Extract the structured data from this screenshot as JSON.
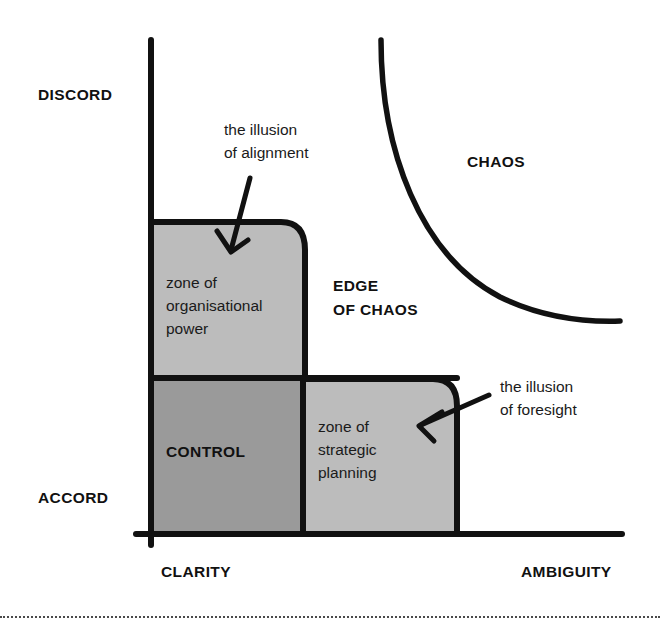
{
  "diagram": {
    "colors": {
      "ink": "#111111",
      "stroke": "#111111",
      "background": "#ffffff",
      "zone_light_gray": "#bcbcbc",
      "zone_dark_gray": "#9a9a9a",
      "footer_rule": "#4a4a4a"
    },
    "axes": {
      "y_top_label": "DISCORD",
      "y_bottom_label": "ACCORD",
      "x_left_label": "CLARITY",
      "x_right_label": "AMBIGUITY"
    },
    "zones": [
      {
        "id": "organisational-power",
        "label": "zone of\norganisational\npower",
        "lines": [
          "zone of",
          "organisational",
          "power"
        ],
        "fill": "#bcbcbc",
        "style": "lowercase"
      },
      {
        "id": "control",
        "label": "CONTROL",
        "lines": [
          "CONTROL"
        ],
        "fill": "#9a9a9a",
        "style": "caps"
      },
      {
        "id": "strategic-planning",
        "label": "zone of\nstrategic\nplanning",
        "lines": [
          "zone of",
          "strategic",
          "planning"
        ],
        "fill": "#bcbcbc",
        "style": "lowercase"
      }
    ],
    "regions": [
      {
        "id": "edge-of-chaos",
        "lines": [
          "EDGE",
          "OF CHAOS"
        ],
        "style": "caps"
      },
      {
        "id": "chaos",
        "lines": [
          "CHAOS"
        ],
        "style": "caps"
      }
    ],
    "callouts": [
      {
        "id": "illusion-of-alignment",
        "lines": [
          "the illusion",
          "of alignment"
        ],
        "points_to": "organisational-power"
      },
      {
        "id": "illusion-of-foresight",
        "lines": [
          "the illusion",
          "of foresight"
        ],
        "points_to": "strategic-planning"
      }
    ]
  }
}
